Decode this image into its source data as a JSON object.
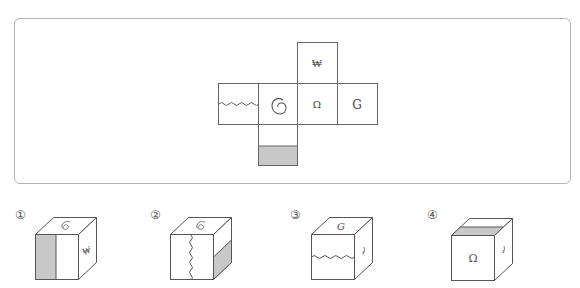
{
  "problem": {
    "net": {
      "faces": [
        {
          "position": "top",
          "symbol": "₩"
        },
        {
          "position": "left",
          "symbol": "wavy-line"
        },
        {
          "position": "center-left",
          "symbol": "spiral-6"
        },
        {
          "position": "center",
          "symbol": "Ω"
        },
        {
          "position": "right",
          "symbol": "G"
        },
        {
          "position": "bottom",
          "symbol": "half-shaded"
        }
      ],
      "labels": {
        "won": "₩",
        "omega": "Ω",
        "g": "G"
      }
    },
    "options": [
      {
        "number": "①",
        "top": "spiral-6",
        "front": "half-shaded-left",
        "right": "₩"
      },
      {
        "number": "②",
        "top": "spiral-6",
        "front": "wavy-line-vertical",
        "right": "half-shaded-bottom"
      },
      {
        "number": "③",
        "top": "G",
        "front": "wavy-line-horizontal",
        "right": "spiral-6"
      },
      {
        "number": "④",
        "top": "shaded-strip-front",
        "front": "Ω",
        "right": "spiral-6"
      }
    ]
  },
  "colors": {
    "line": "#555555",
    "shade": "#c8c8c8",
    "frame": "#b4b4b4"
  }
}
